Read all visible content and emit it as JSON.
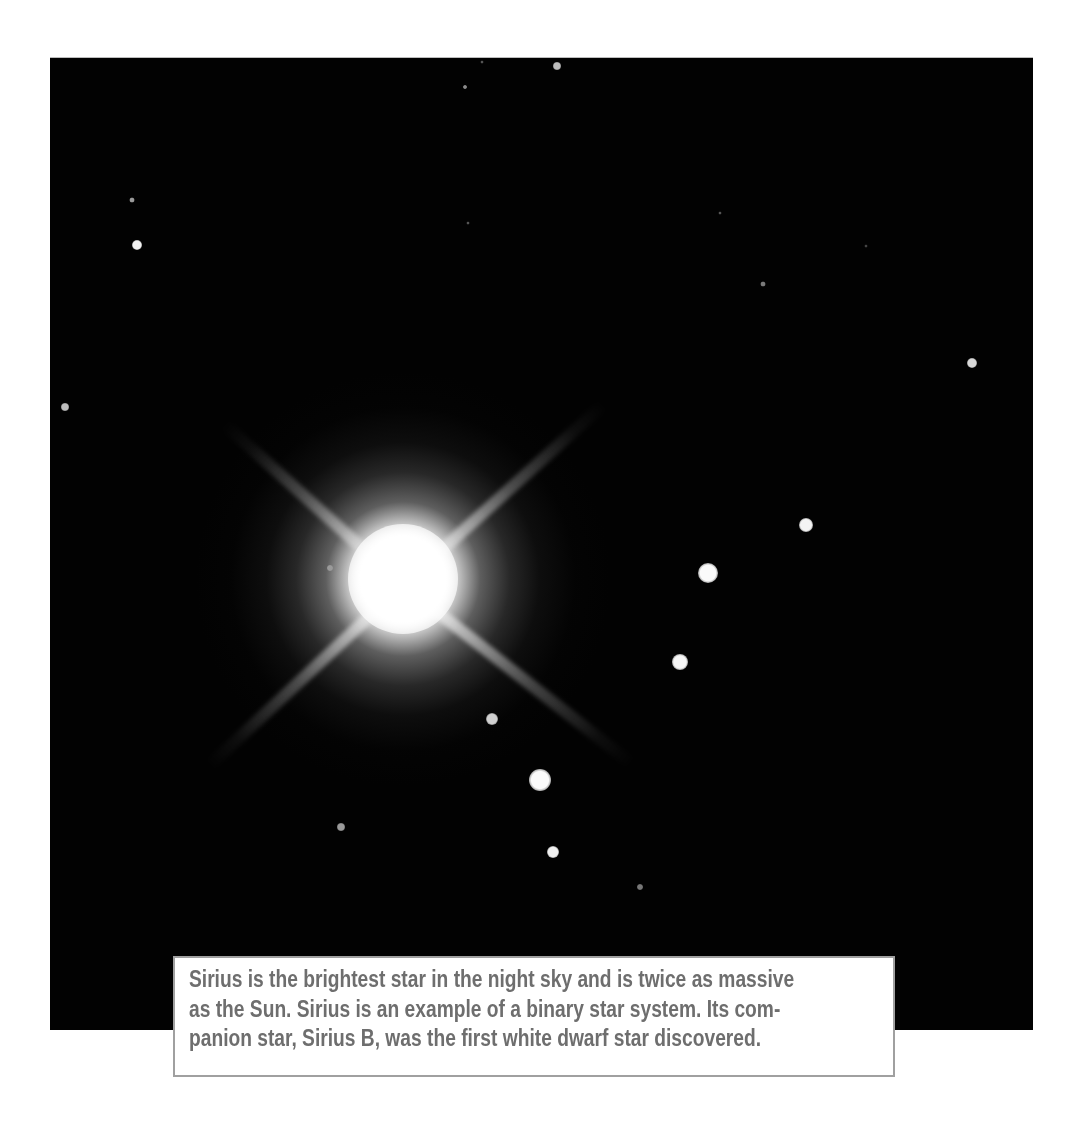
{
  "image": {
    "subject": "Sirius binary star system",
    "background_color": "#020202",
    "bright_star": {
      "name": "Sirius",
      "center": [
        403,
        578
      ],
      "spike_angles_deg": [
        -42,
        -138,
        42,
        138
      ]
    },
    "field_stars": [
      {
        "x": 557,
        "y": 65,
        "r": 4,
        "color": "#bdbdbd"
      },
      {
        "x": 465,
        "y": 86,
        "r": 2,
        "color": "#8a8a8a"
      },
      {
        "x": 482,
        "y": 61,
        "r": 1.5,
        "color": "#555555"
      },
      {
        "x": 132,
        "y": 199,
        "r": 2.5,
        "color": "#9a9a9a"
      },
      {
        "x": 137,
        "y": 244,
        "r": 5,
        "color": "#f2f2f2"
      },
      {
        "x": 468,
        "y": 222,
        "r": 1.5,
        "color": "#555555"
      },
      {
        "x": 720,
        "y": 212,
        "r": 1.5,
        "color": "#555555"
      },
      {
        "x": 866,
        "y": 245,
        "r": 1.5,
        "color": "#444444"
      },
      {
        "x": 763,
        "y": 283,
        "r": 2.5,
        "color": "#7a7a7a"
      },
      {
        "x": 972,
        "y": 362,
        "r": 5,
        "color": "#d8d8d8"
      },
      {
        "x": 65,
        "y": 406,
        "r": 4,
        "color": "#bdbdbd"
      },
      {
        "x": 806,
        "y": 524,
        "r": 7,
        "color": "#f4f4f4"
      },
      {
        "x": 708,
        "y": 572,
        "r": 10,
        "color": "#fafafa"
      },
      {
        "x": 680,
        "y": 661,
        "r": 8,
        "color": "#f6f6f6"
      },
      {
        "x": 492,
        "y": 718,
        "r": 6,
        "color": "#d0d0d0"
      },
      {
        "x": 540,
        "y": 779,
        "r": 11,
        "color": "#fbfbfb"
      },
      {
        "x": 553,
        "y": 851,
        "r": 6,
        "color": "#f0f0f0"
      },
      {
        "x": 341,
        "y": 826,
        "r": 4,
        "color": "#9a9a9a"
      },
      {
        "x": 640,
        "y": 886,
        "r": 3,
        "color": "#777777"
      },
      {
        "x": 330,
        "y": 567,
        "r": 3,
        "color": "#9a9a9a"
      }
    ]
  },
  "caption": {
    "lines": [
      "Sirius is the brightest star in the night sky and is twice as massive",
      "as the Sun. Sirius is an example of a binary star system. Its com-",
      "panion star, Sirius B, was the first white dwarf star discovered."
    ],
    "text_color": "#6e6e6e",
    "border_color": "#a0a0a0"
  }
}
